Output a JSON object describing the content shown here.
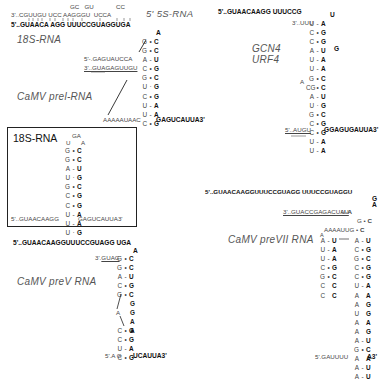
{
  "figure": {
    "panels": {
      "rRNA_5S_18S": {
        "top_loops": "GC   GU             CC",
        "strand_5S": "3'..CGUUGU UCC AAGGGU  UCCA",
        "label_5S": "5' 5S-RNA",
        "strand_18S": "5'..GUAACA AGG UUUCCGUAGGUGA",
        "label_18S": "18S-RNA"
      },
      "camv_prel": {
        "label": "CaMV prel-RNA",
        "top_unpaired": "A",
        "stem_pairs": [
          [
            "G",
            "•",
            "C"
          ],
          [
            "G",
            "•",
            "C"
          ],
          [
            "A",
            "-",
            "U"
          ],
          [
            "C",
            "•",
            "G"
          ],
          [
            "G",
            "•",
            "C"
          ],
          [
            "U",
            "·",
            "G"
          ],
          [
            "C",
            "•",
            "G"
          ],
          [
            "U",
            "-",
            "A"
          ],
          [
            "U",
            "-",
            "A"
          ],
          [
            "C",
            "•",
            "G"
          ]
        ],
        "strand_5prime": "5'-.GAGUAUCCA",
        "strand_3prime": "3'..GUAGAGUUGU",
        "bottom_left": "AAAAAUAAC",
        "bottom_right": "GAGUCAUUA3'"
      },
      "gcn4_urf4": {
        "label_line1": "GCN4",
        "label_line2": "URF4",
        "top_strand": "5'..GUAACAAGG UUUCCG",
        "top_loop": "U",
        "three_prime_start": "3'..UUU",
        "stem_pairs": [
          [
            "U",
            "-",
            "A"
          ],
          [
            "C",
            "•",
            "G"
          ],
          [
            "C",
            "•",
            "G"
          ],
          [
            "A",
            "-",
            "U"
          ],
          [
            "U",
            "-",
            "A"
          ],
          [
            "U",
            "-",
            "A"
          ],
          [
            "G",
            "•",
            "C"
          ],
          [
            "CG",
            "•",
            "C"
          ],
          [
            "A",
            "-",
            "U"
          ],
          [
            "U",
            "·",
            "G"
          ],
          [
            "G",
            "•",
            "C"
          ],
          [
            "C",
            "•",
            "G"
          ],
          [
            "C",
            "•",
            "G"
          ],
          [
            "U",
            "-",
            "A"
          ],
          [
            "U",
            "-",
            "A"
          ]
        ],
        "bulge": "G",
        "loop_A": "A",
        "bottom_left": "5'..AUGU",
        "bottom_right": "GGAGUGAUUA3'"
      },
      "box_18S": {
        "title": "18S-RNA",
        "loop_top": "GA",
        "loop_left": "U",
        "loop_right": "A",
        "stem_pairs": [
          [
            "G",
            "•",
            "C"
          ],
          [
            "G",
            "•",
            "C"
          ],
          [
            "A",
            "-",
            "U"
          ],
          [
            "U",
            "·",
            "G"
          ],
          [
            "G",
            "•",
            "C"
          ],
          [
            "C",
            "•",
            "G"
          ],
          [
            "C",
            "•",
            "G"
          ],
          [
            "U",
            "-",
            "A"
          ],
          [
            "U",
            "-",
            "A"
          ],
          [
            "U",
            "·",
            "G"
          ]
        ],
        "bottom_left": "5'..GUAACAAGG",
        "bottom_right": "GAGUCAUUA3'"
      },
      "camv_previi": {
        "label": "CaMV preVII RNA",
        "top_strand": "5'..GUAACAAGGUUUCCGUAGG UUUCCGUAGGU",
        "top_unpaired": [
          "G",
          "A"
        ],
        "three_prime": "3'..GUACCGAGACUAU",
        "pair1": [
          "U",
          "-",
          "A"
        ],
        "pair2": [
          "G",
          "•",
          "C"
        ],
        "aaaa": "AAAAUUG",
        "pair3": [
          "G",
          "•",
          "C"
        ],
        "left_arm": [
          [
            "A",
            "-",
            "U"
          ],
          [
            "U",
            "-",
            "A"
          ],
          [
            "U",
            "-",
            "A"
          ],
          [
            "C",
            "•",
            "G"
          ],
          [
            "G",
            "•",
            "C"
          ],
          [
            "C",
            " ",
            "C"
          ],
          [
            "C",
            " ",
            "C"
          ]
        ],
        "left_top_A": "A",
        "right_stem": [
          [
            "A",
            "-",
            "U"
          ],
          [
            "C",
            "•",
            "G"
          ],
          [
            "G",
            "•",
            "C"
          ],
          [
            "C",
            "•",
            "G"
          ],
          [
            "C",
            "•",
            "G"
          ],
          [
            "U",
            "-",
            "A"
          ],
          [
            "A",
            " ",
            "A"
          ],
          [
            "A",
            " ",
            "G"
          ],
          [
            "U",
            " ",
            "G"
          ],
          [
            "A",
            " ",
            "A"
          ],
          [
            "A",
            " ",
            "G"
          ],
          [
            "A",
            "-",
            "U"
          ],
          [
            "G",
            "•",
            "C"
          ],
          [
            "A",
            " ",
            "A"
          ],
          [
            "A",
            "-",
            "U"
          ],
          [
            "A",
            "-",
            "U"
          ]
        ],
        "bottom_left": "5'.GAUUUU",
        "bottom_right": "A3'"
      },
      "camv_prev": {
        "label": "CaMV preV RNA",
        "top_strand": "5'..GUAACAAGGUUUCCGUAGG UGA",
        "top_unpaired": "A",
        "three_prime": "3'..GUAG",
        "stem_upper": [
          [
            "G",
            "•",
            "C"
          ],
          [
            "G",
            "•",
            "C"
          ],
          [
            "A",
            "-",
            "U"
          ],
          [
            "C",
            "•",
            "G"
          ],
          [
            "G",
            "•",
            "C"
          ]
        ],
        "right_unpaired": [
          "G",
          "G",
          "A",
          "A"
        ],
        "bulge": "A",
        "stem_lower": [
          [
            "C",
            "•",
            "G"
          ],
          [
            "C",
            "•",
            "G"
          ],
          [
            "U",
            "-",
            "A"
          ],
          [
            "C",
            "•",
            "G"
          ]
        ],
        "bottom_left": "5'.A G",
        "bottom_right": "UCAUUA3'"
      }
    }
  }
}
